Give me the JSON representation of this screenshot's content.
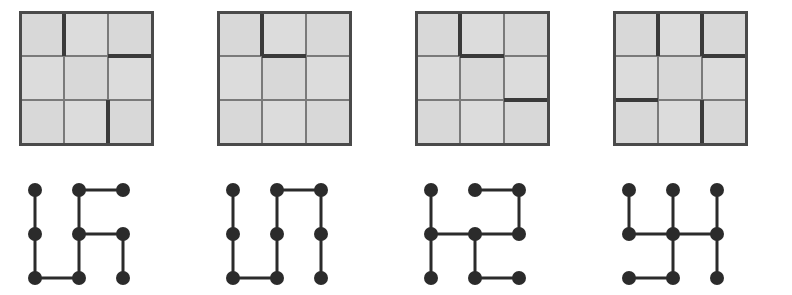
{
  "figure": {
    "panel_count": 4
  },
  "style": {
    "cell_fill": "#d8d8d8",
    "cell_fill_alt": "#dcdcdc",
    "thin_line_color": "#7a7a7a",
    "thick_line_color": "#3a3a3a",
    "border_color": "#4a4a4a",
    "background": "#ffffff",
    "node_color": "#2b2b2b",
    "edge_color": "#2b2b2b",
    "thin_line_width": 2,
    "thick_line_width": 4,
    "border_width": 3,
    "node_radius": 7,
    "edge_width": 3
  },
  "maze_geometry": {
    "rows": 3,
    "cols": 3,
    "cell_size": 44,
    "origin_x": 20,
    "origin_y": 12
  },
  "graph_geometry": {
    "rows": 3,
    "cols": 3,
    "spacing_x": 44,
    "spacing_y": 44,
    "origin_x": 35,
    "origin_y": 25
  },
  "panels": [
    {
      "index": 1,
      "label": "panel-1",
      "maze": {
        "name": "maze-grid-1",
        "v_walls": [
          [
            true,
            false
          ],
          [
            false,
            false
          ],
          [
            false,
            true
          ]
        ],
        "h_walls": [
          [
            false,
            false,
            true
          ],
          [
            false,
            false,
            false
          ]
        ]
      },
      "graph": {
        "name": "graph-1",
        "nodes": [
          {
            "id": "n00",
            "row": 0,
            "col": 0
          },
          {
            "id": "n01",
            "row": 0,
            "col": 1
          },
          {
            "id": "n02",
            "row": 0,
            "col": 2
          },
          {
            "id": "n10",
            "row": 1,
            "col": 0
          },
          {
            "id": "n11",
            "row": 1,
            "col": 1
          },
          {
            "id": "n12",
            "row": 1,
            "col": 2
          },
          {
            "id": "n20",
            "row": 2,
            "col": 0
          },
          {
            "id": "n21",
            "row": 2,
            "col": 1
          },
          {
            "id": "n22",
            "row": 2,
            "col": 2
          }
        ],
        "edges": [
          [
            "n01",
            "n02"
          ],
          [
            "n00",
            "n10"
          ],
          [
            "n10",
            "n20"
          ],
          [
            "n01",
            "n11"
          ],
          [
            "n11",
            "n12"
          ],
          [
            "n12",
            "n22"
          ],
          [
            "n20",
            "n21"
          ],
          [
            "n11",
            "n21"
          ]
        ]
      }
    },
    {
      "index": 2,
      "label": "panel-2",
      "maze": {
        "name": "maze-grid-2",
        "v_walls": [
          [
            true,
            false
          ],
          [
            false,
            false
          ],
          [
            false,
            false
          ]
        ],
        "h_walls": [
          [
            false,
            true,
            false
          ],
          [
            false,
            false,
            false
          ]
        ]
      },
      "graph": {
        "name": "graph-2",
        "nodes": [
          {
            "id": "n00",
            "row": 0,
            "col": 0
          },
          {
            "id": "n01",
            "row": 0,
            "col": 1
          },
          {
            "id": "n02",
            "row": 0,
            "col": 2
          },
          {
            "id": "n10",
            "row": 1,
            "col": 0
          },
          {
            "id": "n11",
            "row": 1,
            "col": 1
          },
          {
            "id": "n12",
            "row": 1,
            "col": 2
          },
          {
            "id": "n20",
            "row": 2,
            "col": 0
          },
          {
            "id": "n21",
            "row": 2,
            "col": 1
          },
          {
            "id": "n22",
            "row": 2,
            "col": 2
          }
        ],
        "edges": [
          [
            "n01",
            "n02"
          ],
          [
            "n00",
            "n10"
          ],
          [
            "n10",
            "n20"
          ],
          [
            "n01",
            "n11"
          ],
          [
            "n11",
            "n21"
          ],
          [
            "n02",
            "n12"
          ],
          [
            "n12",
            "n22"
          ],
          [
            "n20",
            "n21"
          ]
        ]
      }
    },
    {
      "index": 3,
      "label": "panel-3",
      "maze": {
        "name": "maze-grid-3",
        "v_walls": [
          [
            true,
            false
          ],
          [
            false,
            false
          ],
          [
            false,
            false
          ]
        ],
        "h_walls": [
          [
            false,
            true,
            false
          ],
          [
            false,
            false,
            true
          ]
        ]
      },
      "graph": {
        "name": "graph-3",
        "nodes": [
          {
            "id": "n00",
            "row": 0,
            "col": 0
          },
          {
            "id": "n01",
            "row": 0,
            "col": 1
          },
          {
            "id": "n02",
            "row": 0,
            "col": 2
          },
          {
            "id": "n10",
            "row": 1,
            "col": 0
          },
          {
            "id": "n11",
            "row": 1,
            "col": 1
          },
          {
            "id": "n12",
            "row": 1,
            "col": 2
          },
          {
            "id": "n20",
            "row": 2,
            "col": 0
          },
          {
            "id": "n21",
            "row": 2,
            "col": 1
          },
          {
            "id": "n22",
            "row": 2,
            "col": 2
          }
        ],
        "edges": [
          [
            "n01",
            "n02"
          ],
          [
            "n00",
            "n10"
          ],
          [
            "n10",
            "n20"
          ],
          [
            "n02",
            "n12"
          ],
          [
            "n10",
            "n11"
          ],
          [
            "n11",
            "n12"
          ],
          [
            "n11",
            "n21"
          ],
          [
            "n21",
            "n22"
          ]
        ]
      }
    },
    {
      "index": 4,
      "label": "panel-4",
      "maze": {
        "name": "maze-grid-4",
        "v_walls": [
          [
            true,
            true
          ],
          [
            false,
            false
          ],
          [
            false,
            true
          ]
        ],
        "h_walls": [
          [
            false,
            false,
            true
          ],
          [
            true,
            false,
            false
          ]
        ]
      },
      "graph": {
        "name": "graph-4",
        "nodes": [
          {
            "id": "n00",
            "row": 0,
            "col": 0
          },
          {
            "id": "n01",
            "row": 0,
            "col": 1
          },
          {
            "id": "n02",
            "row": 0,
            "col": 2
          },
          {
            "id": "n10",
            "row": 1,
            "col": 0
          },
          {
            "id": "n11",
            "row": 1,
            "col": 1
          },
          {
            "id": "n12",
            "row": 1,
            "col": 2
          },
          {
            "id": "n20",
            "row": 2,
            "col": 0
          },
          {
            "id": "n21",
            "row": 2,
            "col": 1
          },
          {
            "id": "n22",
            "row": 2,
            "col": 2
          }
        ],
        "edges": [
          [
            "n00",
            "n10"
          ],
          [
            "n01",
            "n11"
          ],
          [
            "n02",
            "n12"
          ],
          [
            "n10",
            "n11"
          ],
          [
            "n11",
            "n12"
          ],
          [
            "n11",
            "n21"
          ],
          [
            "n12",
            "n22"
          ],
          [
            "n20",
            "n21"
          ]
        ]
      }
    }
  ]
}
